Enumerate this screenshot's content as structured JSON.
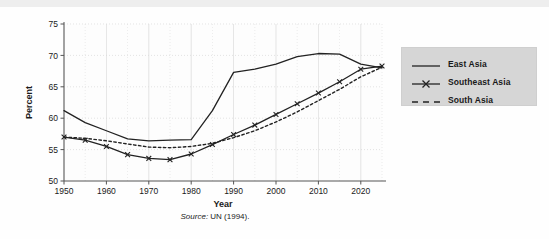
{
  "chart_data": {
    "type": "line",
    "title": "",
    "xlabel": "Year",
    "ylabel": "Percent",
    "xlim": [
      1950,
      2025
    ],
    "ylim": [
      50,
      75
    ],
    "xticks": [
      1950,
      1960,
      1970,
      1980,
      1990,
      2000,
      2010,
      2020
    ],
    "yticks": [
      50,
      55,
      60,
      65,
      70,
      75
    ],
    "xtick_labels": [
      "1950",
      "1960",
      "1970",
      "1980",
      "1990",
      "2000",
      "2010",
      "2020"
    ],
    "ytick_labels": [
      "50",
      "55",
      "60",
      "65",
      "70",
      "75"
    ],
    "grid": true,
    "grid_minor_spacing_x": 5,
    "legend_position": "right",
    "x": [
      1950,
      1955,
      1960,
      1965,
      1970,
      1975,
      1980,
      1985,
      1990,
      1995,
      2000,
      2005,
      2010,
      2015,
      2020,
      2025
    ],
    "series": [
      {
        "name": "East Asia",
        "style": "solid",
        "marker": "none",
        "color": "#222222",
        "values": [
          61.2,
          59.3,
          58.0,
          56.7,
          56.4,
          56.5,
          56.6,
          61.2,
          67.3,
          67.8,
          68.6,
          69.8,
          70.3,
          70.2,
          68.6,
          68.0
        ]
      },
      {
        "name": "Southeast Asia",
        "style": "solid",
        "marker": "x",
        "color": "#222222",
        "values": [
          57.0,
          56.5,
          55.5,
          54.2,
          53.6,
          53.4,
          54.3,
          55.8,
          57.4,
          58.9,
          60.6,
          62.3,
          64.0,
          65.8,
          67.8,
          68.3
        ]
      },
      {
        "name": "South Asia",
        "style": "dashed",
        "marker": "none",
        "color": "#222222",
        "values": [
          57.0,
          56.8,
          56.4,
          55.9,
          55.4,
          55.3,
          55.5,
          56.0,
          56.9,
          58.0,
          59.4,
          61.0,
          62.8,
          64.6,
          66.6,
          68.1
        ]
      }
    ],
    "source": {
      "prefix": "Source:",
      "text": " UN (1994)."
    }
  },
  "legend": {
    "items": [
      {
        "label": "East Asia",
        "sample": "solid-line"
      },
      {
        "label": "Southeast Asia",
        "sample": "solid-line-x-marker"
      },
      {
        "label": "South Asia",
        "sample": "dashed-line"
      }
    ]
  },
  "colors": {
    "line": "#222222",
    "axis": "#555555",
    "grid": "#d8d8d8",
    "legend_bg": "#d6d6d6",
    "band": "#eeeeee",
    "page_bg": "#fefefe"
  }
}
